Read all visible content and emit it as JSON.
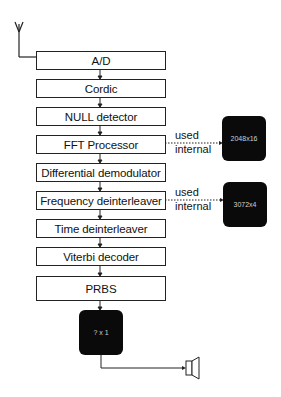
{
  "diagram": {
    "type": "block-diagram",
    "input": "antenna",
    "output": "speaker",
    "blocks": [
      {
        "id": "ad",
        "label": "A/D"
      },
      {
        "id": "cordic",
        "label": "Cordic"
      },
      {
        "id": "null",
        "label": "NULL detector"
      },
      {
        "id": "fft",
        "label": "FFT Processor"
      },
      {
        "id": "diff",
        "label": "Differential demodulator"
      },
      {
        "id": "freq",
        "label": "Frequency deinterleaver"
      },
      {
        "id": "time",
        "label": "Time deinterleaver"
      },
      {
        "id": "viterbi",
        "label": "Viterbi decoder"
      },
      {
        "id": "prbs",
        "label": "PRBS"
      }
    ],
    "memories": [
      {
        "id": "mem_fft",
        "label": "2048x16",
        "connected_to": "fft",
        "note_line1": "used",
        "note_line2": "internal"
      },
      {
        "id": "mem_freq",
        "label": "3072x4",
        "connected_to": "freq",
        "note_line1": "used",
        "note_line2": "internal"
      },
      {
        "id": "mem_out",
        "label": "? x 1",
        "connected_to": "prbs"
      }
    ],
    "caption": "Fig. The data for the buffer (only partially visible, text cut off)"
  }
}
